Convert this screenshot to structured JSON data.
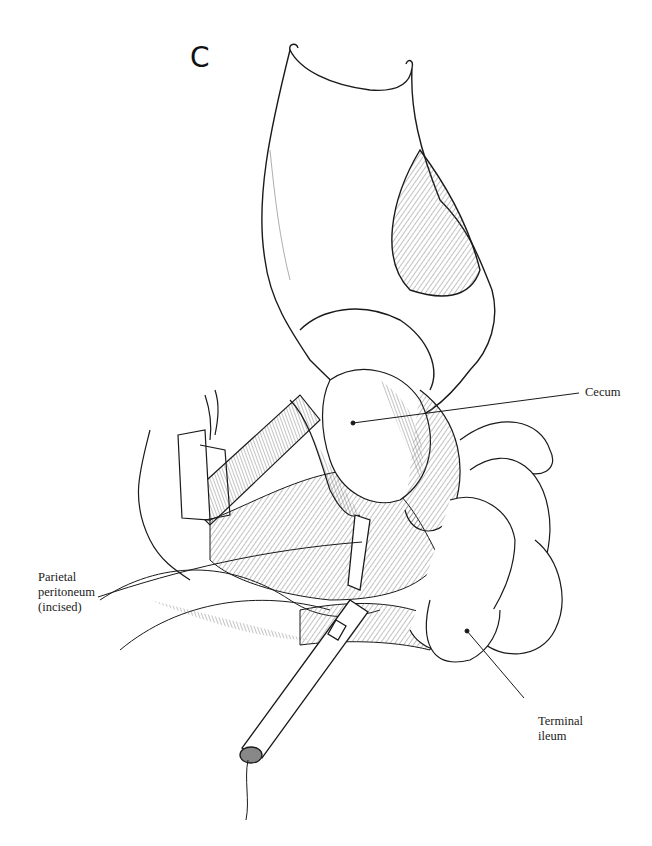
{
  "figure": {
    "panel_letter": "C",
    "labels": {
      "cecum": "Cecum",
      "parietal_peritoneum": "Parietal\nperitoneum\n(incised)",
      "terminal_ileum": "Terminal\nileum"
    },
    "colors": {
      "ink": "#1a1a1a",
      "hatch": "#555555",
      "paper": "#ffffff"
    }
  }
}
